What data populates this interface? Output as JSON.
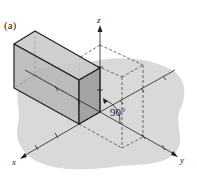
{
  "figure": {
    "panel_label": "(a)",
    "angle_label": "90°",
    "axes": {
      "x": "x",
      "y": "y",
      "z": "z"
    },
    "colors": {
      "background": "#ffffff",
      "ground": "#d9d9d9",
      "box_front": "#b5b5b5",
      "box_side": "#9c9c9c",
      "box_top": "#c8c8c8",
      "line": "#222222"
    }
  }
}
